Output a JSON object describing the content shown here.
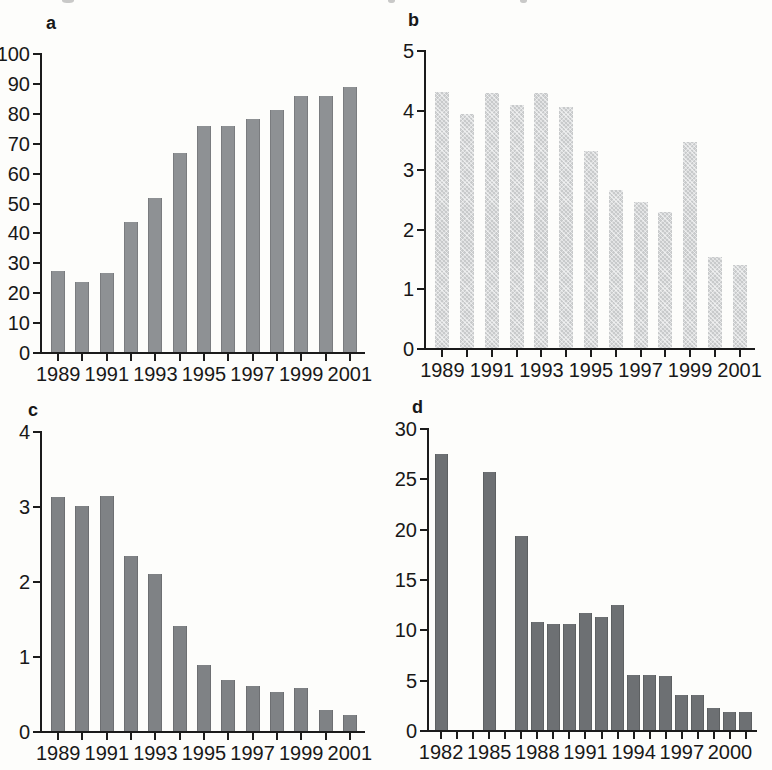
{
  "figure": {
    "type": "four-panel scanned bar-chart figure",
    "background_color": "#fdfdfb",
    "axis_color": "#1b1b1b",
    "text_color": "#181818"
  },
  "chart_data": [
    {
      "id": "a",
      "type": "bar",
      "panel_label": "a",
      "title": "",
      "xlabel": "",
      "ylabel": "",
      "x": [
        1989,
        1990,
        1991,
        1992,
        1993,
        1994,
        1995,
        1996,
        1997,
        1998,
        1999,
        2000,
        2001
      ],
      "values": [
        27,
        23.5,
        26.5,
        43.5,
        51.5,
        66.5,
        75.5,
        75.5,
        78,
        81,
        85.5,
        85.5,
        88.5
      ],
      "ylim": [
        0,
        100
      ],
      "ytick_step": 10,
      "ytick_labels": [
        "0",
        "10",
        "20",
        "30",
        "40",
        "50",
        "60",
        "70",
        "80",
        "90",
        "100"
      ],
      "xtick_label_every": 2,
      "xtick_labels": [
        "1989",
        "1991",
        "1993",
        "1995",
        "1997",
        "1999",
        "2001"
      ],
      "grid": false,
      "legend": null,
      "bar_color": "#8e9194",
      "bar_texture": "solid"
    },
    {
      "id": "b",
      "type": "bar",
      "panel_label": "b",
      "title": "",
      "xlabel": "",
      "ylabel": "",
      "x": [
        1989,
        1990,
        1991,
        1992,
        1993,
        1994,
        1995,
        1996,
        1997,
        1998,
        1999,
        2000,
        2001
      ],
      "values": [
        4.3,
        3.93,
        4.28,
        4.07,
        4.28,
        4.05,
        3.3,
        2.65,
        2.45,
        2.28,
        3.45,
        1.52,
        1.4
      ],
      "ylim": [
        0,
        5
      ],
      "ytick_step": 1,
      "ytick_labels": [
        "0",
        "1",
        "2",
        "3",
        "4",
        "5"
      ],
      "xtick_label_every": 2,
      "xtick_labels": [
        "1989",
        "1991",
        "1993",
        "1995",
        "1997",
        "1999",
        "2001"
      ],
      "grid": false,
      "legend": null,
      "bar_color": "#c8cacb",
      "bar_texture": "halftone"
    },
    {
      "id": "c",
      "type": "bar",
      "panel_label": "c",
      "title": "",
      "xlabel": "",
      "ylabel": "",
      "x": [
        1989,
        1990,
        1991,
        1992,
        1993,
        1994,
        1995,
        1996,
        1997,
        1998,
        1999,
        2000,
        2001
      ],
      "values": [
        3.12,
        3.0,
        3.13,
        2.33,
        2.1,
        1.4,
        0.88,
        0.68,
        0.6,
        0.52,
        0.58,
        0.28,
        0.22
      ],
      "ylim": [
        0,
        4
      ],
      "ytick_step": 1,
      "ytick_labels": [
        "0",
        "1",
        "2",
        "3",
        "4"
      ],
      "xtick_label_every": 2,
      "xtick_labels": [
        "1989",
        "1991",
        "1993",
        "1995",
        "1997",
        "1999",
        "2001"
      ],
      "grid": false,
      "legend": null,
      "bar_color": "#7f8285",
      "bar_texture": "solid"
    },
    {
      "id": "d",
      "type": "bar",
      "panel_label": "d",
      "title": "",
      "xlabel": "",
      "ylabel": "",
      "x": [
        1982,
        1983,
        1984,
        1985,
        1986,
        1987,
        1988,
        1989,
        1990,
        1991,
        1992,
        1993,
        1994,
        1995,
        1996,
        1997,
        1998,
        1999,
        2000,
        2001
      ],
      "values": [
        27.4,
        null,
        null,
        25.6,
        null,
        19.3,
        10.7,
        10.5,
        10.5,
        11.6,
        11.2,
        12.4,
        5.5,
        5.5,
        5.4,
        3.5,
        3.5,
        2.2,
        1.8,
        1.8
      ],
      "ylim": [
        0,
        30
      ],
      "ytick_step": 5,
      "ytick_labels": [
        "0",
        "5",
        "10",
        "15",
        "20",
        "25",
        "30"
      ],
      "xtick_label_every": 3,
      "xtick_labels": [
        "1982",
        "1985",
        "1988",
        "1991",
        "1994",
        "1997",
        "2000"
      ],
      "grid": false,
      "legend": null,
      "bar_color": "#6d7073",
      "bar_texture": "solid"
    }
  ]
}
